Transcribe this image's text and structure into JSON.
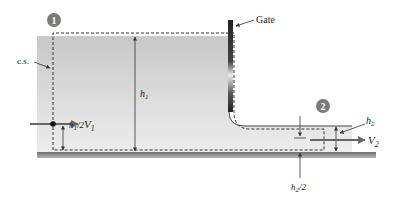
{
  "diagram": {
    "labels": {
      "gate": "Gate",
      "control_surface": "c.s.",
      "station_1": "1",
      "station_2": "2",
      "v1": "V",
      "v1_sub": "1",
      "v2": "V",
      "v2_sub": "2",
      "h1": "h",
      "h1_sub": "1",
      "h1_half": "h",
      "h1_half_sub": "1",
      "h1_half_tail": "/2",
      "h2": "h",
      "h2_sub": "2",
      "h2_half": "h",
      "h2_half_sub": "2",
      "h2_half_tail": "/2"
    },
    "colors": {
      "water_top": "#c9c9c9",
      "water_bottom": "#ececec",
      "floor": "#8a8a8a",
      "gate_dark": "#333333",
      "badge": "#7a7a7a",
      "line": "#333333"
    }
  }
}
